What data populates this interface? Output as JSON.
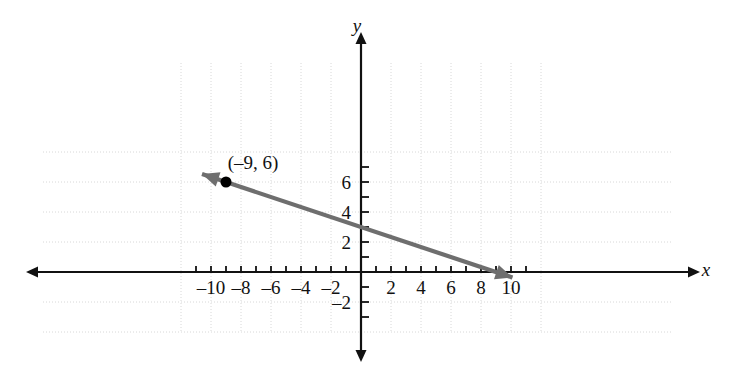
{
  "chart_data": {
    "type": "line",
    "title": "",
    "xlabel": "x",
    "ylabel": "y",
    "xlim": [
      -11.5,
      11
    ],
    "ylim": [
      -2.5,
      7.5
    ],
    "grid": true,
    "grid_step": 2,
    "tick_step": 1,
    "legend": "none",
    "xticks": [
      -10,
      -8,
      -6,
      -4,
      -2,
      2,
      4,
      6,
      8,
      10
    ],
    "xticklabels": [
      "–10",
      "–8",
      "–6",
      "–4",
      "–2",
      "2",
      "4",
      "6",
      "8",
      "10"
    ],
    "yticks": [
      2,
      4,
      6,
      -2
    ],
    "yticklabels": [
      "2",
      "4",
      "6",
      "–2"
    ],
    "series": [
      {
        "name": "line",
        "equation": "y = -1/3 x + 3",
        "slope": -0.3333,
        "intercept": 3,
        "x_intercept": 9,
        "arrows": "both",
        "color": "#6e6e6e",
        "endpoints": [
          {
            "x": -10.6,
            "y": 6.53
          },
          {
            "x": 10.1,
            "y": -0.37
          }
        ]
      }
    ],
    "points": [
      {
        "x": -9,
        "y": 6,
        "label": "(–9, 6)",
        "marker": "filled-circle",
        "color": "#000000"
      }
    ],
    "annotations": [
      {
        "text": "(–9, 6)",
        "x": -7.2,
        "y": 6.9
      }
    ]
  },
  "axes": {
    "x_axis_name": "x-axis",
    "y_axis_name": "y-axis",
    "x_label": "x",
    "y_label": "y"
  },
  "colors": {
    "line": "#6e6e6e",
    "axis": "#111111",
    "grid": "#d8d8d8",
    "point": "#000000",
    "background": "#ffffff"
  }
}
